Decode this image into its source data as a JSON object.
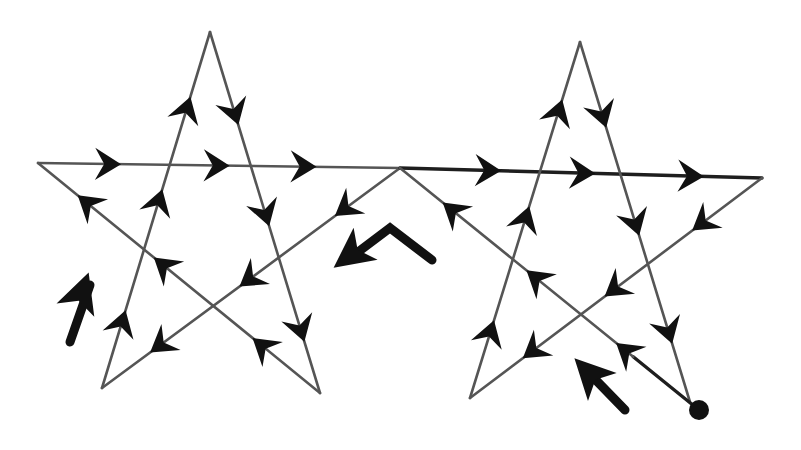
{
  "figure": {
    "title": "Two pentagrams traced as one continuous path",
    "colors": {
      "line": "#555555",
      "line_dark": "#1e1e1e",
      "arrow": "#111111",
      "background": "#ffffff"
    }
  },
  "stars": [
    {
      "name": "left-star",
      "vertices": {
        "top": [
          210,
          32
        ],
        "left": [
          38,
          163
        ],
        "right": [
          400,
          168
        ],
        "bottom_left": [
          102,
          388
        ],
        "bottom_right": [
          320,
          393
        ]
      }
    },
    {
      "name": "right-star",
      "vertices": {
        "top": [
          580,
          42
        ],
        "left": [
          400,
          168
        ],
        "right": [
          762,
          178
        ],
        "bottom_left": [
          470,
          398
        ],
        "bottom_right": [
          690,
          402
        ]
      }
    }
  ],
  "edges": [
    {
      "name": "left-star-bottomleft-to-top",
      "from": [
        102,
        388
      ],
      "to": [
        210,
        32
      ],
      "arrows": [
        0.18,
        0.52,
        0.78
      ]
    },
    {
      "name": "left-star-top-to-bottomright",
      "from": [
        210,
        32
      ],
      "to": [
        320,
        393
      ],
      "arrows": [
        0.22,
        0.5,
        0.82
      ]
    },
    {
      "name": "left-star-bottomright-to-left",
      "from": [
        320,
        393
      ],
      "to": [
        38,
        163
      ],
      "arrows": [
        0.2,
        0.55,
        0.82
      ]
    },
    {
      "name": "left-star-left-to-right",
      "from": [
        38,
        163
      ],
      "to": [
        400,
        168
      ],
      "arrows": [
        0.19,
        0.49,
        0.73
      ]
    },
    {
      "name": "left-star-right-to-bottomleft",
      "from": [
        400,
        168
      ],
      "to": [
        102,
        388
      ],
      "arrows": [
        0.18,
        0.5,
        0.8
      ]
    },
    {
      "name": "upper-line-to-right-star-right",
      "from": [
        400,
        168
      ],
      "to": [
        762,
        178
      ],
      "arrows": [
        0.24,
        0.5,
        0.8
      ],
      "dark": true
    },
    {
      "name": "right-star-right-to-bottomleft",
      "from": [
        762,
        178
      ],
      "to": [
        470,
        398
      ],
      "arrows": [
        0.2,
        0.5,
        0.78
      ]
    },
    {
      "name": "right-star-bottomleft-to-top",
      "from": [
        470,
        398
      ],
      "to": [
        580,
        42
      ],
      "arrows": [
        0.18,
        0.5,
        0.8
      ]
    },
    {
      "name": "right-star-top-to-bottomright",
      "from": [
        580,
        42
      ],
      "to": [
        690,
        402
      ],
      "arrows": [
        0.2,
        0.5,
        0.8
      ]
    },
    {
      "name": "right-star-bottomright-to-left",
      "from": [
        699,
        410
      ],
      "to": [
        400,
        168
      ],
      "arrows": [
        0.24,
        0.54,
        0.82
      ],
      "dark_start": 0.22
    }
  ],
  "start_point": {
    "name": "start-dot",
    "center": [
      699,
      410
    ],
    "radius": 10
  },
  "direction_hints": [
    {
      "name": "hint-arrow-left-star",
      "points": [
        [
          70,
          342
        ],
        [
          90,
          285
        ]
      ],
      "head": [
        86,
        280
      ]
    },
    {
      "name": "hint-arrow-bent-center",
      "points": [
        [
          432,
          260
        ],
        [
          390,
          228
        ],
        [
          350,
          258
        ]
      ],
      "head": [
        340,
        263
      ]
    },
    {
      "name": "hint-arrow-right-star",
      "points": [
        [
          625,
          410
        ],
        [
          588,
          372
        ]
      ],
      "head": [
        580,
        364
      ]
    }
  ]
}
